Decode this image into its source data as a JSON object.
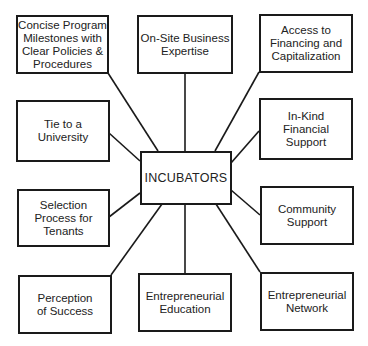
{
  "diagram": {
    "center": {
      "label": "INCUBATORS"
    },
    "nodes": [
      {
        "id": "milestones",
        "label": "Concise Program\nMilestones with\nClear Policies &\nProcedures"
      },
      {
        "id": "onsite",
        "label": "On-Site Business\nExpertise"
      },
      {
        "id": "financing",
        "label": "Access to\nFinancing and\nCapitalization"
      },
      {
        "id": "university",
        "label": "Tie to a\nUniversity"
      },
      {
        "id": "inkind",
        "label": "In-Kind\nFinancial\nSupport"
      },
      {
        "id": "selection",
        "label": "Selection\nProcess for\nTenants"
      },
      {
        "id": "community",
        "label": "Community\nSupport"
      },
      {
        "id": "perception",
        "label": "Perception\nof Success"
      },
      {
        "id": "education",
        "label": "Entrepreneurial\nEducation"
      },
      {
        "id": "network",
        "label": "Entrepreneurial\nNetwork"
      }
    ],
    "colors": {
      "line": "#1a1a1a",
      "text": "#222222",
      "background": "#ffffff"
    }
  }
}
